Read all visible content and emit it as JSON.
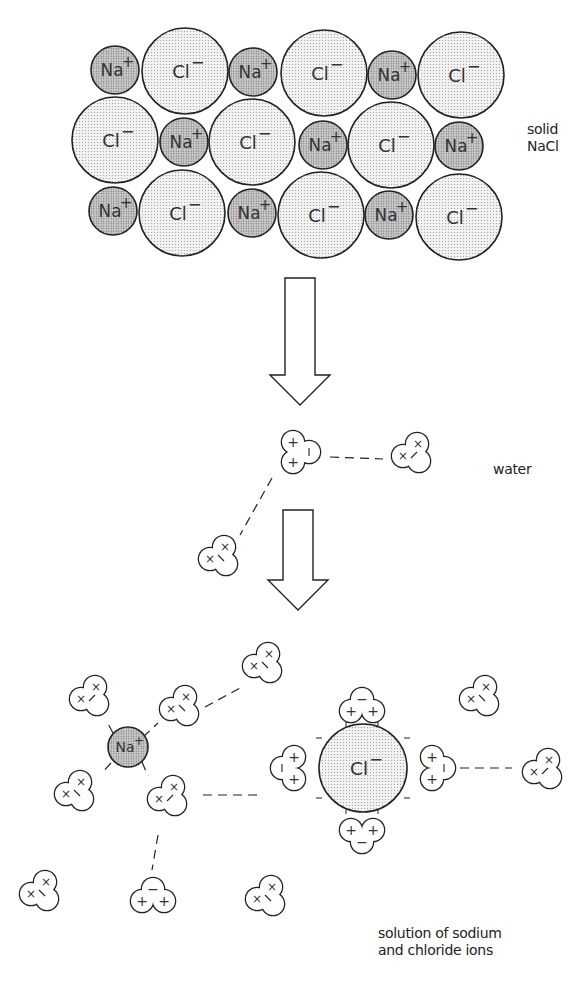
{
  "labels": {
    "solid": [
      "solid",
      "NaCl"
    ],
    "water": "water",
    "solution": [
      "solution of sodium",
      "and chloride ions"
    ]
  },
  "colors": {
    "na_fill": "#bdbdbd",
    "cl_fill": "#e6e6e6",
    "stroke": "#222222",
    "background": "#ffffff"
  },
  "ions": {
    "na_label": "Na",
    "na_charge": "+",
    "cl_label": "Cl",
    "cl_charge": "−"
  },
  "lattice": [
    {
      "type": "Na",
      "x": 115,
      "y": 70,
      "r": 24
    },
    {
      "type": "Cl",
      "x": 185,
      "y": 71,
      "r": 43
    },
    {
      "type": "Na",
      "x": 253,
      "y": 72,
      "r": 24
    },
    {
      "type": "Cl",
      "x": 324,
      "y": 73,
      "r": 43
    },
    {
      "type": "Na",
      "x": 392,
      "y": 75,
      "r": 24
    },
    {
      "type": "Cl",
      "x": 461,
      "y": 75,
      "r": 43
    },
    {
      "type": "Cl",
      "x": 115,
      "y": 140,
      "r": 43
    },
    {
      "type": "Na",
      "x": 184,
      "y": 142,
      "r": 24
    },
    {
      "type": "Cl",
      "x": 252,
      "y": 142,
      "r": 43
    },
    {
      "type": "Na",
      "x": 323,
      "y": 145,
      "r": 24
    },
    {
      "type": "Cl",
      "x": 391,
      "y": 145,
      "r": 43
    },
    {
      "type": "Na",
      "x": 459,
      "y": 146,
      "r": 24
    },
    {
      "type": "Na",
      "x": 113,
      "y": 211,
      "r": 24
    },
    {
      "type": "Cl",
      "x": 182,
      "y": 213,
      "r": 43
    },
    {
      "type": "Na",
      "x": 252,
      "y": 213,
      "r": 24
    },
    {
      "type": "Cl",
      "x": 321,
      "y": 215,
      "r": 43
    },
    {
      "type": "Na",
      "x": 389,
      "y": 215,
      "r": 24
    },
    {
      "type": "Cl",
      "x": 459,
      "y": 217,
      "r": 43
    }
  ],
  "arrows": [
    {
      "x": 300,
      "y_top": 278,
      "y_bottom": 405
    },
    {
      "x": 298,
      "y_top": 510,
      "y_bottom": 610
    }
  ],
  "free_ions": [
    {
      "type": "Na",
      "x": 128,
      "y": 747,
      "r": 20
    },
    {
      "type": "Cl",
      "x": 363,
      "y": 768,
      "r": 44
    }
  ],
  "water_molecules": [
    {
      "x": 301,
      "y": 452,
      "rot": 0,
      "signs": [
        "+",
        "+",
        "|"
      ],
      "kind": "Hplus"
    },
    {
      "x": 412,
      "y": 452,
      "rot": 0,
      "signs": [
        "×",
        "×",
        "/"
      ],
      "kind": "x"
    },
    {
      "x": 219,
      "y": 555,
      "rot": 0,
      "signs": [
        "×",
        "×",
        "\\"
      ],
      "kind": "x"
    },
    {
      "x": 90,
      "y": 695,
      "rot": 0,
      "signs": [
        "×",
        "×",
        "/"
      ],
      "kind": "x"
    },
    {
      "x": 180,
      "y": 705,
      "rot": 0,
      "signs": [
        "×",
        "×",
        "\\"
      ],
      "kind": "x"
    },
    {
      "x": 263,
      "y": 662,
      "rot": 0,
      "signs": [
        "×",
        "×",
        "\\"
      ],
      "kind": "x"
    },
    {
      "x": 75,
      "y": 790,
      "rot": 0,
      "signs": [
        "×",
        "×",
        "\\"
      ],
      "kind": "x"
    },
    {
      "x": 168,
      "y": 795,
      "rot": 0,
      "signs": [
        "×",
        "×",
        "/"
      ],
      "kind": "x"
    },
    {
      "x": 40,
      "y": 890,
      "rot": 0,
      "signs": [
        "×",
        "×",
        "\\"
      ],
      "kind": "x"
    },
    {
      "x": 153,
      "y": 895,
      "rot": 0,
      "signs": [
        "+",
        "+",
        "−"
      ],
      "kind": "Hdown"
    },
    {
      "x": 266,
      "y": 895,
      "rot": 0,
      "signs": [
        "×",
        "×",
        "\\"
      ],
      "kind": "x"
    },
    {
      "x": 480,
      "y": 695,
      "rot": 0,
      "signs": [
        "×",
        "×",
        "\\"
      ],
      "kind": "x"
    },
    {
      "x": 362,
      "y": 705,
      "rot": 0,
      "signs": [
        "+",
        "+",
        "−"
      ],
      "kind": "Hdown"
    },
    {
      "x": 362,
      "y": 836,
      "rot": 0,
      "signs": [
        "+",
        "+",
        "−"
      ],
      "kind": "Hup"
    },
    {
      "x": 288,
      "y": 768,
      "rot": 0,
      "signs": [
        "+",
        "+",
        "|"
      ],
      "kind": "Hright"
    },
    {
      "x": 438,
      "y": 768,
      "rot": 0,
      "signs": [
        "+",
        "+",
        "|"
      ],
      "kind": "Hleft"
    },
    {
      "x": 543,
      "y": 768,
      "rot": 0,
      "signs": [
        "×",
        "×",
        "/"
      ],
      "kind": "x"
    }
  ],
  "bonds": [
    [
      330,
      457,
      383,
      459
    ],
    [
      272,
      478,
      240,
      535
    ],
    [
      113,
      733,
      106,
      720
    ],
    [
      143,
      737,
      158,
      723
    ],
    [
      111,
      763,
      102,
      773
    ],
    [
      142,
      762,
      148,
      776
    ],
    [
      205,
      707,
      242,
      687
    ],
    [
      203,
      795,
      260,
      795
    ],
    [
      158,
      835,
      152,
      870
    ],
    [
      445,
      768,
      512,
      768
    ]
  ]
}
